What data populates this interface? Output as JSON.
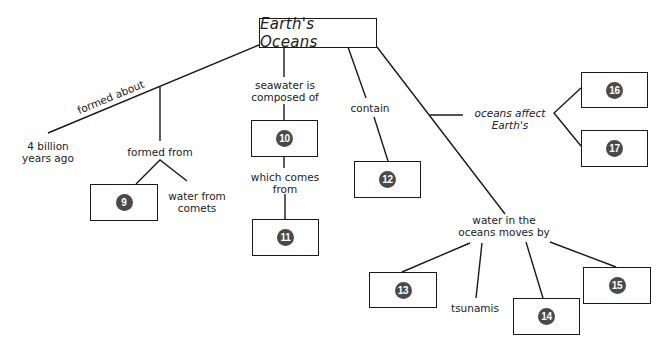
{
  "diagram": {
    "type": "concept-map",
    "root": {
      "label": "Earth's Oceans"
    },
    "labels": {
      "formed_about": "formed about",
      "four_billion_l1": "4 billion",
      "four_billion_l2": "years ago",
      "formed_from": "formed from",
      "water_comets_l1": "water from",
      "water_comets_l2": "comets",
      "seawater_l1": "seawater is",
      "seawater_l2": "composed of",
      "which_comes_l1": "which comes",
      "which_comes_l2": "from",
      "contain": "contain",
      "oceans_affect_l1": "oceans affect",
      "oceans_affect_l2": "Earth's",
      "water_moves_l1": "water in the",
      "water_moves_l2": "oceans moves by",
      "tsunamis": "tsunamis"
    },
    "blanks": [
      {
        "id": "9",
        "label": "9"
      },
      {
        "id": "10",
        "label": "10"
      },
      {
        "id": "11",
        "label": "11"
      },
      {
        "id": "12",
        "label": "12"
      },
      {
        "id": "13",
        "label": "13"
      },
      {
        "id": "14",
        "label": "14"
      },
      {
        "id": "15",
        "label": "15"
      },
      {
        "id": "16",
        "label": "16"
      },
      {
        "id": "17",
        "label": "17"
      }
    ]
  }
}
